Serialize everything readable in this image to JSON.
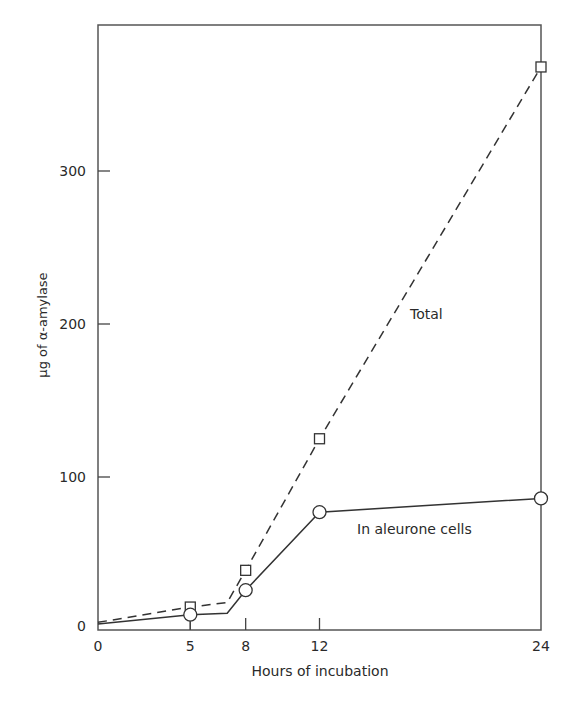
{
  "header_fragment": "",
  "chart_data": {
    "type": "line",
    "title": "",
    "xlabel": "Hours of incubation",
    "ylabel": "µg of α-amylase",
    "xlim": [
      0,
      24
    ],
    "ylim": [
      0,
      390
    ],
    "x_ticks": [
      0,
      5,
      8,
      12,
      24
    ],
    "y_ticks": [
      0,
      100,
      200,
      300
    ],
    "grid": false,
    "legend": "inline labels",
    "series": [
      {
        "name": "Total",
        "style": "dashed",
        "marker": "square",
        "x": [
          0,
          5,
          7,
          8,
          12,
          24
        ],
        "y": [
          5,
          15,
          18,
          39,
          125,
          368
        ],
        "marker_x": [
          5,
          8,
          12,
          24
        ],
        "marker_y": [
          15,
          39,
          125,
          368
        ]
      },
      {
        "name": "In aleurone cells",
        "style": "solid",
        "marker": "circle",
        "x": [
          0,
          5,
          7,
          8,
          12,
          24
        ],
        "y": [
          4,
          10,
          11,
          26,
          77,
          86
        ],
        "marker_x": [
          5,
          8,
          12,
          24
        ],
        "marker_y": [
          10,
          26,
          77,
          86
        ]
      }
    ],
    "annotations": [
      {
        "text": "Total",
        "x": 16.8,
        "y": 205
      },
      {
        "text": "In aleurone cells",
        "x": 16.5,
        "y": 62
      }
    ]
  }
}
